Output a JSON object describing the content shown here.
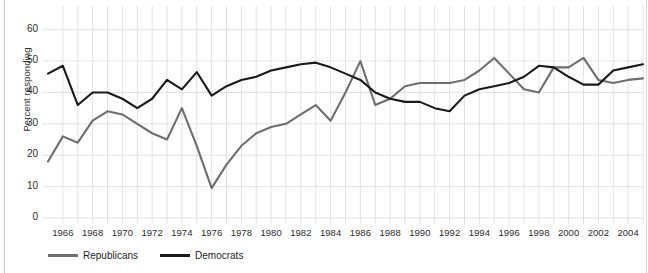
{
  "chart_data": {
    "type": "line",
    "title": "",
    "xlabel": "",
    "ylabel": "Percent responding",
    "ylim": [
      0,
      65
    ],
    "xlim": [
      1965,
      2005
    ],
    "yticks": [
      0,
      10,
      20,
      30,
      40,
      50,
      60
    ],
    "grid": true,
    "grid_orientation": "both",
    "legend_position": "bottom-left",
    "x": [
      1965,
      1966,
      1967,
      1968,
      1969,
      1970,
      1971,
      1972,
      1973,
      1974,
      1975,
      1976,
      1977,
      1978,
      1979,
      1980,
      1981,
      1982,
      1983,
      1984,
      1985,
      1986,
      1987,
      1988,
      1989,
      1990,
      1991,
      1992,
      1993,
      1994,
      1995,
      1996,
      1997,
      1998,
      1999,
      2000,
      2001,
      2002,
      2003,
      2004,
      2005
    ],
    "xtick_labels": [
      "1966",
      "1968",
      "1970",
      "1972",
      "1974",
      "1976",
      "1978",
      "1980",
      "1982",
      "1984",
      "1986",
      "1988",
      "1990",
      "1992",
      "1994",
      "1996",
      "1998",
      "2000",
      "2002",
      "2004"
    ],
    "series": [
      {
        "name": "Republicans",
        "color": "#6e6e6e",
        "values": [
          18,
          26,
          24,
          31,
          34,
          33,
          30,
          27,
          25,
          35,
          23,
          9.5,
          17,
          23,
          27,
          29,
          30,
          33,
          36,
          31,
          40,
          50,
          36,
          38,
          42,
          43,
          43,
          43,
          44,
          47,
          51,
          46,
          41,
          40,
          48,
          48,
          51,
          44,
          43,
          44,
          44.5
        ]
      },
      {
        "name": "Democrats",
        "color": "#1a1a1a",
        "values": [
          46,
          48.5,
          36,
          40,
          40,
          38,
          35,
          38,
          44,
          41,
          46.5,
          39,
          42,
          44,
          45,
          47,
          48,
          49,
          49.5,
          48,
          46,
          44,
          40,
          38,
          37,
          37,
          35,
          34,
          39,
          41,
          42,
          43,
          45,
          48.5,
          48,
          45,
          42.5,
          42.5,
          47,
          48,
          49
        ]
      }
    ]
  },
  "legend": {
    "entries": [
      {
        "label": "Republicans"
      },
      {
        "label": "Democrats"
      }
    ]
  },
  "axis": {
    "y_label": "Percent responding"
  }
}
